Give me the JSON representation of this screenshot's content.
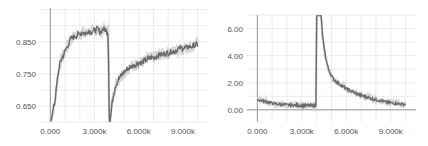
{
  "chart_data": [
    {
      "type": "line",
      "title": "",
      "xlabel": "",
      "ylabel": "",
      "xlim": [
        -700,
        10700
      ],
      "ylim": [
        0.6,
        0.955
      ],
      "grid": true,
      "x_ticks": [
        0,
        3000,
        6000,
        9000
      ],
      "x_tick_labels": [
        "0.000",
        "3.000k",
        "6.000k",
        "9.000k"
      ],
      "y_ticks": [
        0.65,
        0.75,
        0.85
      ],
      "y_tick_labels": [
        "0.650",
        "0.750",
        "0.850"
      ],
      "series": [
        {
          "name": "smoothed",
          "color": "#6a6a6a",
          "x": [
            0,
            100,
            200,
            300,
            400,
            500,
            600,
            700,
            800,
            1000,
            1200,
            1400,
            1600,
            1800,
            2000,
            2200,
            2400,
            2600,
            2800,
            3000,
            3200,
            3400,
            3600,
            3800,
            3900,
            3950,
            4000,
            4050,
            4100,
            4200,
            4300,
            4400,
            4600,
            4800,
            5000,
            5200,
            5400,
            5600,
            5800,
            6000,
            6200,
            6400,
            6600,
            6800,
            7000,
            7200,
            7400,
            7600,
            7800,
            8000,
            8200,
            8400,
            8600,
            8800,
            9000,
            9200,
            9400,
            9600,
            9800,
            10000
          ],
          "y": [
            0.6,
            0.62,
            0.64,
            0.66,
            0.7,
            0.74,
            0.77,
            0.79,
            0.8,
            0.82,
            0.84,
            0.86,
            0.865,
            0.87,
            0.875,
            0.88,
            0.875,
            0.885,
            0.88,
            0.885,
            0.89,
            0.88,
            0.89,
            0.885,
            0.88,
            0.8,
            0.62,
            0.6,
            0.62,
            0.66,
            0.69,
            0.71,
            0.73,
            0.745,
            0.755,
            0.765,
            0.77,
            0.775,
            0.78,
            0.785,
            0.785,
            0.79,
            0.795,
            0.8,
            0.8,
            0.805,
            0.81,
            0.81,
            0.815,
            0.815,
            0.82,
            0.82,
            0.825,
            0.83,
            0.83,
            0.83,
            0.835,
            0.835,
            0.84,
            0.84
          ]
        }
      ]
    },
    {
      "type": "line",
      "title": "",
      "xlabel": "",
      "ylabel": "",
      "xlim": [
        -700,
        10700
      ],
      "ylim": [
        -0.9,
        7.0
      ],
      "grid": true,
      "x_ticks": [
        0,
        3000,
        6000,
        9000
      ],
      "x_tick_labels": [
        "0.000",
        "3.000k",
        "6.000k",
        "9.000k"
      ],
      "y_ticks": [
        0,
        2,
        4,
        6
      ],
      "y_tick_labels": [
        "0.00",
        "2.00",
        "4.00",
        "6.00"
      ],
      "series": [
        {
          "name": "smoothed",
          "color": "#6a6a6a",
          "x": [
            0,
            200,
            400,
            600,
            800,
            1000,
            1200,
            1400,
            1600,
            1800,
            2000,
            2400,
            2800,
            3200,
            3600,
            3950,
            4000,
            4300,
            4350,
            4400,
            4500,
            4600,
            4700,
            4800,
            5000,
            5200,
            5400,
            5600,
            5800,
            6000,
            6300,
            6600,
            6900,
            7200,
            7500,
            7800,
            8100,
            8400,
            8700,
            9000,
            9300,
            9600,
            10000
          ],
          "y": [
            0.75,
            0.7,
            0.65,
            0.6,
            0.55,
            0.5,
            0.45,
            0.42,
            0.4,
            0.38,
            0.36,
            0.34,
            0.33,
            0.32,
            0.31,
            0.3,
            7.0,
            7.0,
            6.2,
            5.4,
            4.6,
            3.9,
            3.4,
            3.0,
            2.5,
            2.2,
            2.0,
            1.85,
            1.7,
            1.55,
            1.4,
            1.25,
            1.1,
            1.0,
            0.9,
            0.8,
            0.72,
            0.65,
            0.58,
            0.52,
            0.48,
            0.44,
            0.4
          ]
        }
      ]
    }
  ]
}
